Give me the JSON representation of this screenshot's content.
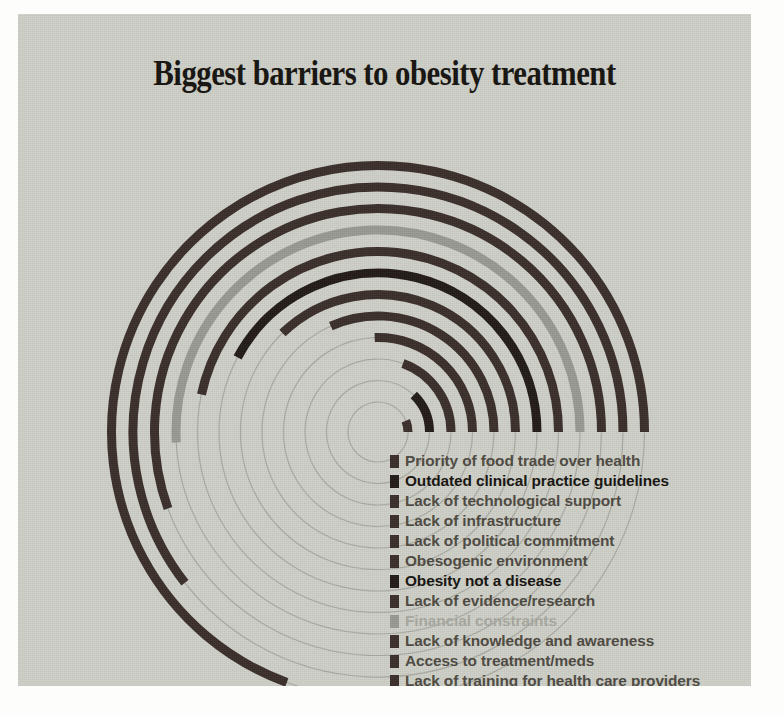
{
  "title": "Biggest barriers to obesity treatment",
  "colors": {
    "background": "#fdfdfb",
    "panel": "#cfd0c8",
    "bar_dark": "#3b2f2a",
    "bar_darkest": "#231b18",
    "bar_grey": "#9a9a93",
    "track": "#8d8d85",
    "text": "#4e4a42",
    "text_strong": "#16130f",
    "text_faint": "#a9a9a1"
  },
  "chart_data": {
    "type": "bar",
    "title": "Biggest barriers to obesity treatment",
    "subtype": "radial-bar",
    "xlabel": "",
    "ylabel": "",
    "grid": true,
    "legend_position": "right-of-center",
    "categories": [
      "Priority of food trade over health",
      "Outdated clinical practice guidelines",
      "Lack of technological support",
      "Lack of infrastructure",
      "Lack of political commitment",
      "Obesogenic environment",
      "Obesity not a disease",
      "Lack of evidence/research",
      "Financial constraints",
      "Lack of knowledge and awareness",
      "Access to treatment/meds",
      "Lack of training for health care providers"
    ],
    "values": [
      6,
      8,
      10,
      12,
      15,
      18,
      22,
      27,
      33,
      41,
      52,
      74
    ],
    "ylim": [
      0,
      100
    ],
    "units": "percent"
  },
  "legend": {
    "items": [
      {
        "label": "Priority of food trade over health",
        "color": "#3b2f2a",
        "emphasis": "normal"
      },
      {
        "label": "Outdated clinical practice guidelines",
        "color": "#231b18",
        "emphasis": "strong"
      },
      {
        "label": "Lack of technological support",
        "color": "#3b2f2a",
        "emphasis": "normal"
      },
      {
        "label": "Lack of infrastructure",
        "color": "#3b2f2a",
        "emphasis": "normal"
      },
      {
        "label": "Lack of political commitment",
        "color": "#3b2f2a",
        "emphasis": "normal"
      },
      {
        "label": "Obesogenic environment",
        "color": "#3b2f2a",
        "emphasis": "normal"
      },
      {
        "label": "Obesity not a disease",
        "color": "#231b18",
        "emphasis": "strong"
      },
      {
        "label": "Lack of evidence/research",
        "color": "#3b2f2a",
        "emphasis": "normal"
      },
      {
        "label": "Financial constraints",
        "color": "#9a9a93",
        "emphasis": "faint"
      },
      {
        "label": "Lack of knowledge and awareness",
        "color": "#3b2f2a",
        "emphasis": "normal"
      },
      {
        "label": "Access to treatment/meds",
        "color": "#3b2f2a",
        "emphasis": "normal"
      },
      {
        "label": "Lack of training for health care providers",
        "color": "#3b2f2a",
        "emphasis": "normal"
      }
    ]
  },
  "radial": {
    "center_x": 360,
    "center_y": 418,
    "inner_radius": 30,
    "ring_step": 21.5,
    "ring_thickness": 9,
    "track_thickness": 1.2,
    "sweeps_deg": [
      22,
      46,
      70,
      92,
      114,
      134,
      152,
      168,
      183,
      200,
      218,
      250
    ]
  }
}
